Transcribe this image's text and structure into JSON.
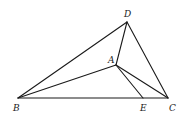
{
  "diagram": {
    "type": "geometry-figure",
    "points": {
      "B": {
        "label": "B",
        "x": 18,
        "y": 98,
        "label_x": 13,
        "label_y": 111
      },
      "C": {
        "label": "C",
        "x": 168,
        "y": 98,
        "label_x": 169,
        "label_y": 111
      },
      "D": {
        "label": "D",
        "x": 127,
        "y": 22,
        "label_x": 124,
        "label_y": 17
      },
      "A": {
        "label": "A",
        "x": 116,
        "y": 65,
        "label_x": 108,
        "label_y": 63
      },
      "E": {
        "label": "E",
        "x": 143,
        "y": 98,
        "label_x": 140,
        "label_y": 111
      }
    },
    "segments": [
      {
        "from": "B",
        "to": "D"
      },
      {
        "from": "D",
        "to": "C"
      },
      {
        "from": "B",
        "to": "C"
      },
      {
        "from": "D",
        "to": "A"
      },
      {
        "from": "B",
        "to": "A"
      },
      {
        "from": "A",
        "to": "C"
      },
      {
        "from": "A",
        "to": "E"
      }
    ],
    "colors": {
      "line": "#1a1a1a",
      "background": "#ffffff"
    }
  }
}
